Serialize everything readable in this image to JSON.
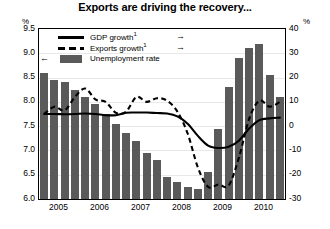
{
  "chart_data": {
    "type": "bar",
    "title": "Exports are driving the recovery...",
    "xlabel": "",
    "ylabel": "%",
    "y2label": "%",
    "ylim": [
      6.0,
      9.5
    ],
    "y2lim": [
      -30,
      40
    ],
    "grid": true,
    "legend_position": "top-left",
    "left_axis_unit": "%",
    "right_axis_unit": "%",
    "left_ticks": [
      "9.5",
      "9.0",
      "8.5",
      "8.0",
      "7.5",
      "7.0",
      "6.5",
      "6.0"
    ],
    "left_tick_values": [
      9.5,
      9.0,
      8.5,
      8.0,
      7.5,
      7.0,
      6.5,
      6.0
    ],
    "right_ticks": [
      "40",
      "30",
      "20",
      "10",
      "0",
      "-10",
      "-20",
      "-30"
    ],
    "right_tick_values": [
      40,
      30,
      20,
      10,
      0,
      -10,
      -20,
      -30
    ],
    "year_labels": [
      "2005",
      "2006",
      "2007",
      "2008",
      "2009",
      "2010"
    ],
    "categories": [
      "2005Q1",
      "2005Q2",
      "2005Q3",
      "2005Q4",
      "2006Q1",
      "2006Q2",
      "2006Q3",
      "2006Q4",
      "2007Q1",
      "2007Q2",
      "2007Q3",
      "2007Q4",
      "2008Q1",
      "2008Q2",
      "2008Q3",
      "2008Q4",
      "2009Q1",
      "2009Q2",
      "2009Q3",
      "2009Q4",
      "2010Q1",
      "2010Q2",
      "2010Q3",
      "2010Q4"
    ],
    "series": [
      {
        "name": "Unemployment rate",
        "type": "bar",
        "axis": "left",
        "color": "#5a5a5a",
        "values": [
          8.6,
          8.45,
          8.4,
          8.25,
          8.1,
          7.95,
          7.75,
          7.55,
          7.35,
          7.2,
          6.95,
          6.8,
          6.45,
          6.35,
          6.25,
          6.2,
          6.55,
          7.45,
          8.3,
          8.9,
          9.1,
          9.2,
          8.55,
          8.1
        ]
      },
      {
        "name": "GDP growth",
        "type": "line",
        "axis": "right",
        "color": "#000000",
        "style": "solid",
        "footnote": "1",
        "values": [
          5.0,
          5.0,
          4.9,
          5.0,
          5.2,
          5.0,
          4.5,
          4.5,
          5.5,
          5.6,
          5.6,
          5.4,
          5.2,
          4.0,
          1.0,
          -4.0,
          -8.0,
          -9.0,
          -8.5,
          -6.0,
          -1.0,
          2.5,
          3.2,
          3.5
        ]
      },
      {
        "name": "Exports growth",
        "type": "line",
        "axis": "right",
        "color": "#000000",
        "style": "dashed",
        "footnote": "1",
        "values": [
          5.0,
          8.0,
          6.5,
          12.0,
          15.5,
          11.0,
          10.0,
          5.5,
          6.0,
          12.0,
          10.0,
          11.5,
          10.5,
          6.0,
          -3.0,
          -17.0,
          -25.0,
          -24.0,
          -24.5,
          -13.0,
          3.0,
          10.5,
          8.0,
          10.0
        ]
      }
    ]
  },
  "legend": {
    "items": [
      {
        "label": "GDP growth",
        "footnote": "1",
        "key": "solid-line",
        "arrow": "→",
        "arrow_side": "right"
      },
      {
        "label": "Exports growth",
        "footnote": "1",
        "key": "dashed-line",
        "arrow": "→",
        "arrow_side": "right"
      },
      {
        "label": "Unemployment rate",
        "footnote": "",
        "key": "filled-box",
        "arrow": "←",
        "arrow_side": "left"
      }
    ]
  }
}
